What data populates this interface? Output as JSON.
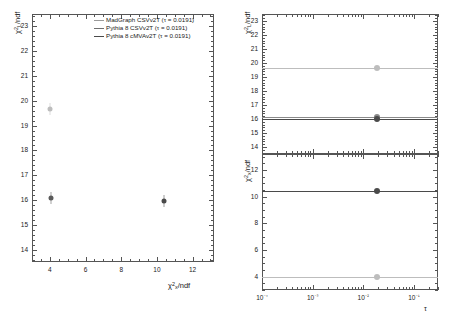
{
  "figure": {
    "background": "#ffffff",
    "tau_value": "0.0191"
  },
  "colors": {
    "madgraph": "#9a9a9a",
    "pythia_csv": "#6f6f6f",
    "pythia_cmva": "#4a4a4a",
    "axis": "#555555",
    "text": "#1a1a1a"
  },
  "legend": {
    "position": "top-right-of-left-panel",
    "entries": [
      {
        "label": "MadGraph CSVv2T (τ = 0.0191)",
        "color": "#9a9a9a"
      },
      {
        "label": "Pythia 8 CSVv2T (τ = 0.0191)",
        "color": "#6f6f6f"
      },
      {
        "label": "Pythia 8 cMVAv2T (τ = 0.0191)",
        "color": "#4a4a4a"
      }
    ]
  },
  "left_panel": {
    "name": "chi2-L-vs-chi2-x-scatter",
    "xlabel": "χ²x/ndf",
    "ylabel": "χ²L/ndf",
    "xticks": [
      "4",
      "6",
      "8",
      "10",
      "12"
    ],
    "yticks": [
      "14",
      "15",
      "16",
      "17",
      "18",
      "19",
      "20",
      "21",
      "22",
      "23"
    ]
  },
  "right_top_panel": {
    "name": "chi2-L-vs-tau",
    "ylabel": "χ²L/ndf",
    "yticks": [
      "14",
      "15",
      "16",
      "17",
      "18",
      "19",
      "20",
      "21",
      "22",
      "23"
    ]
  },
  "right_bottom_panel": {
    "name": "chi2-x-vs-tau",
    "xlabel": "τ",
    "ylabel": "χ²x/ndf",
    "xticks": [
      "10⁻⁴",
      "10⁻³",
      "10⁻²",
      "10⁻¹"
    ],
    "yticks": [
      "4",
      "6",
      "8",
      "10",
      "12"
    ]
  },
  "chart_data": [
    {
      "type": "scatter",
      "name": "left-panel-chi2L-vs-chi2x",
      "title": "",
      "xlabel": "χ²x/ndf",
      "ylabel": "χ²L/ndf",
      "xlim": [
        3.0,
        13.2
      ],
      "ylim": [
        13.5,
        23.5
      ],
      "xscale": "linear",
      "yscale": "linear",
      "grid": false,
      "xticks": [
        4,
        6,
        8,
        10,
        12
      ],
      "yticks": [
        14,
        15,
        16,
        17,
        18,
        19,
        20,
        21,
        22,
        23
      ],
      "points": [
        {
          "series": "MadGraph CSVv2T",
          "x": 4.0,
          "y": 19.65,
          "color": "#bdbdbd"
        },
        {
          "series": "Pythia 8 CSVv2T",
          "x": 4.05,
          "y": 16.1,
          "color": "#5a5a5a"
        },
        {
          "series": "Pythia 8 cMVAv2T",
          "x": 10.4,
          "y": 15.95,
          "color": "#4a4a4a"
        }
      ]
    },
    {
      "type": "line",
      "name": "right-top-chi2L-vs-tau",
      "title": "",
      "xlabel": "",
      "ylabel": "χ²L/ndf",
      "xlim": [
        0.0001,
        0.3
      ],
      "ylim": [
        13.5,
        23.5
      ],
      "xscale": "log",
      "yscale": "linear",
      "grid": false,
      "yticks": [
        14,
        15,
        16,
        17,
        18,
        19,
        20,
        21,
        22,
        23
      ],
      "series": [
        {
          "name": "MadGraph CSVv2T",
          "color": "#bdbdbd",
          "level": 19.65,
          "marker_x": 0.0191,
          "marker_y": 19.65
        },
        {
          "name": "Pythia 8 CSVv2T",
          "color": "#8a8a8a",
          "level": 16.12,
          "marker_x": 0.0191,
          "marker_y": 16.12
        },
        {
          "name": "Pythia 8 cMVAv2T",
          "color": "#4a4a4a",
          "level": 15.98,
          "marker_x": 0.0191,
          "marker_y": 15.98
        }
      ]
    },
    {
      "type": "line",
      "name": "right-bottom-chi2x-vs-tau",
      "title": "",
      "xlabel": "τ",
      "ylabel": "χ²x/ndf",
      "xlim": [
        0.0001,
        0.3
      ],
      "ylim": [
        3.0,
        13.2
      ],
      "xscale": "log",
      "yscale": "linear",
      "grid": false,
      "xticks": [
        0.0001,
        0.001,
        0.01,
        0.1
      ],
      "yticks": [
        4,
        6,
        8,
        10,
        12
      ],
      "series": [
        {
          "name": "Pythia 8 cMVAv2T",
          "color": "#4a4a4a",
          "level": 10.45,
          "marker_x": 0.0191,
          "marker_y": 10.45
        },
        {
          "name": "MadGraph CSVv2T",
          "color": "#bdbdbd",
          "level": 4.0,
          "marker_x": 0.0191,
          "marker_y": 4.0
        }
      ]
    }
  ]
}
